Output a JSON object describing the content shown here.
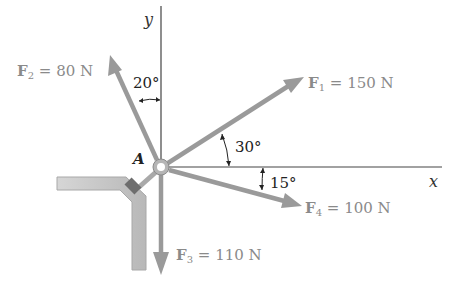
{
  "diagram": {
    "title": "",
    "axes": {
      "x_label": "x",
      "y_label": "y"
    },
    "point": {
      "label": "A"
    },
    "forces": [
      {
        "id": "F1",
        "symbol": "F",
        "subscript": "1",
        "equals": " = ",
        "value": "150 N",
        "angle_label": "30°",
        "angle_ref": "above +x axis"
      },
      {
        "id": "F2",
        "symbol": "F",
        "subscript": "2",
        "equals": " = ",
        "value": "80 N",
        "angle_label": "20°",
        "angle_ref": "left of +y axis"
      },
      {
        "id": "F3",
        "symbol": "F",
        "subscript": "3",
        "equals": " = ",
        "value": "110 N",
        "angle_label": "",
        "angle_ref": "along -y axis"
      },
      {
        "id": "F4",
        "symbol": "F",
        "subscript": "4",
        "equals": " = ",
        "value": "100 N",
        "angle_label": "15°",
        "angle_ref": "below +x axis"
      }
    ],
    "colors": {
      "arrow": "#9a9a9a",
      "axis": "#333333",
      "support": "#c8c8c8",
      "support_edge": "#9c9c9c",
      "bolt": "#6e6e6e",
      "label_gray": "#8a8a8a"
    }
  }
}
